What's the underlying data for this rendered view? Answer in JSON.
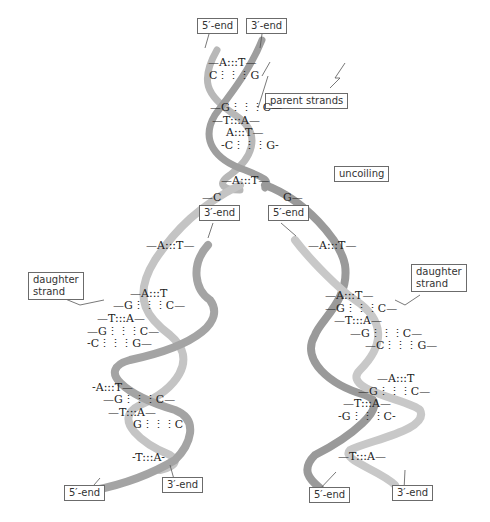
{
  "diagram": {
    "colors": {
      "ribbon_light": "#e2e2e2",
      "ribbon_dark": "#9a9a9a",
      "label_border": "#6b6b6b",
      "text": "#222222"
    },
    "labels": {
      "top_5_end": "5′-end",
      "top_3_end": "3′-end",
      "parent_strands": "parent strands",
      "uncoiling": "uncoiling",
      "fork_3_end": "3′-end",
      "fork_5_end": "5′-end",
      "left_daughter_strand": "daughter\nstrand",
      "right_daughter_strand": "daughter\nstrand",
      "bottom_left_5_end": "5′-end",
      "bottom_left_3_end": "3′-end",
      "bottom_right_5_end": "5′-end",
      "bottom_right_3_end": "3′-end"
    },
    "base_pairs": {
      "parent": [
        "—A:::T—",
        "C⋮⋮⋮G",
        "—G⋮⋮⋮C—",
        "—T:::A—",
        "A:::T—",
        "-C⋮⋮⋮G-",
        "—A:::T—"
      ],
      "fork_left": "—C",
      "fork_right": "G—",
      "left_single": "—A:::T—",
      "right_single": "—A:::T—",
      "left_daughter_upper": [
        "—A:::T",
        "—G⋮⋮⋮C—",
        "—T:::A—",
        "—G⋮⋮⋮C—",
        "-C⋮⋮⋮G—"
      ],
      "left_daughter_lower": [
        "-A:::T—",
        "—G⋮⋮⋮C—",
        "—T:::A—",
        "G⋮⋮⋮C",
        "-T:::A-"
      ],
      "right_daughter_upper": [
        "—A:::T—",
        "—G⋮⋮⋮C—",
        "—T:::A—",
        "—G⋮⋮⋮C—",
        "—C⋮⋮⋮G—"
      ],
      "right_daughter_lower": [
        "—A:::T",
        "—G⋮⋮⋮C—",
        "—T:::A—",
        "-G⋮⋮⋮C-",
        "—T:::A—"
      ]
    }
  }
}
